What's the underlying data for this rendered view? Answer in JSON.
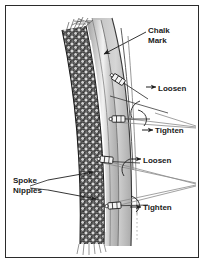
{
  "figure": {
    "kind": "bicycle-wheel-truing-diagram",
    "background_color": "#ffffff",
    "border_color": "#2b2b2b"
  },
  "labels": {
    "chalk_mark": "Chalk\nMark",
    "loosen_1": "Loosen",
    "tighten_1": "Tighten",
    "loosen_2": "Loosen",
    "tighten_2": "Tighten",
    "spoke_nipples": "Spoke\nNipples"
  },
  "colors": {
    "tire_dark": "#4a4a4a",
    "tire_speckle": "#2e2e2e",
    "rim_gray": "#b5b5b5",
    "rim_gray_light": "#cfcfcf",
    "highlight_white": "#ffffff",
    "line_dark": "#1f1f1f",
    "leader_gray": "#8a8a8a",
    "text": "#1a1a1a"
  },
  "diagram_parts": {
    "tire": "textured dark knobby tire band curving down the left",
    "rim": "gray rim band with white highlight stripe",
    "chalk_mark": "white stripe on rim sidewall indicated by arrow",
    "nipples": [
      {
        "id": "nipple-loosen-1",
        "action": "Loosen",
        "rotation": "counter-clockwise"
      },
      {
        "id": "nipple-tighten-1",
        "action": "Tighten",
        "rotation": "clockwise"
      },
      {
        "id": "nipple-loosen-2",
        "action": "Loosen",
        "rotation": "counter-clockwise"
      },
      {
        "id": "nipple-tighten-2",
        "action": "Tighten",
        "rotation": "clockwise"
      }
    ]
  }
}
